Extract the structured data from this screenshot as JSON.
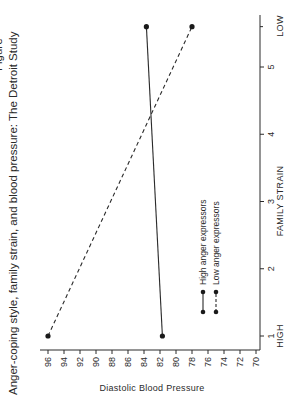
{
  "chart_data": {
    "type": "line",
    "title": "Anger-coping style, family strain, and blood pressure: The Detroit Study",
    "title_prefix_cut": "Figure",
    "xlabel": "FAMILY STRAIN",
    "ylabel": "Diastolic Blood Pressure",
    "x_ticks": [
      "1",
      "2",
      "3",
      "4",
      "5"
    ],
    "x_end_labels": {
      "low_end": "HIGH",
      "high_end": "LOW"
    },
    "y_ticks": [
      "70",
      "72",
      "74",
      "76",
      "78",
      "80",
      "82",
      "84",
      "86",
      "88",
      "90",
      "92",
      "94",
      "96"
    ],
    "ylim": [
      70,
      97
    ],
    "xlim": [
      0.8,
      5.8
    ],
    "grid": false,
    "legend_position": "lower right (inside)",
    "orientation": "rotated 90 degrees counter-clockwise",
    "series": [
      {
        "name": "High anger expressors",
        "style": "solid",
        "x": [
          "HIGH",
          "LOW"
        ],
        "x_numeric": [
          1,
          5.6
        ],
        "values": [
          81.7,
          83.7
        ]
      },
      {
        "name": "Low anger expressors",
        "style": "dashed",
        "x": [
          "HIGH",
          "LOW"
        ],
        "x_numeric": [
          1,
          5.6
        ],
        "values": [
          96,
          78
        ]
      }
    ]
  },
  "legend": {
    "items": [
      {
        "label": "High anger expressors"
      },
      {
        "label": "Low anger expressors"
      }
    ]
  },
  "colors": {
    "ink": "#2a2a2a",
    "background": "#ffffff"
  }
}
